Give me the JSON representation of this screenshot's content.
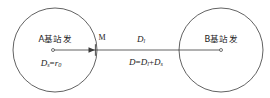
{
  "figure": {
    "type": "geometry-diagram",
    "background_color": "#ffffff",
    "stroke_color": "#3a3a3a",
    "text_color": "#1c1c1c"
  },
  "left_cell": {
    "station_label": "A基站发",
    "radius_formula": {
      "base": "D",
      "base_sub": "s",
      "operator": "=",
      "value": "r",
      "value_sub": "0"
    },
    "center_marker": "circle-center-dot"
  },
  "right_cell": {
    "station_label": "B基站发",
    "center_marker": "circle-center-dot"
  },
  "boundary_point": {
    "label": "M"
  },
  "segment_label": {
    "base": "D",
    "base_sub": "l"
  },
  "total_formula": {
    "lhs": "D",
    "equals": "=",
    "term1": "D",
    "term1_sub": "l",
    "plus": "+",
    "term2": "D",
    "term2_sub": "s"
  }
}
